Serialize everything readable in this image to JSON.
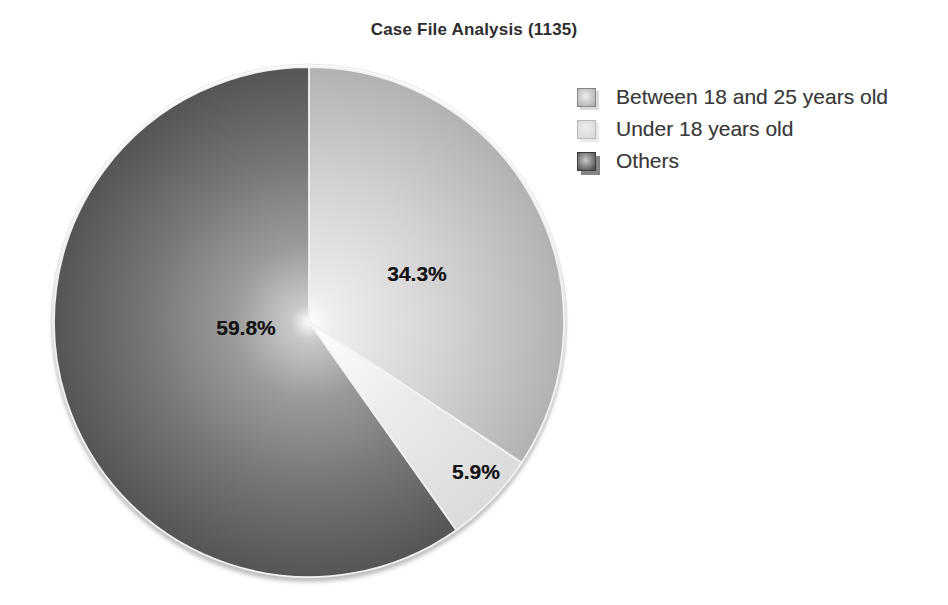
{
  "page": {
    "background_color": "#ffffff"
  },
  "chart_data": {
    "type": "pie",
    "title": "Case File Analysis (1135)",
    "total_count": 1135,
    "start_angle": "12-o-clock",
    "direction": "clockwise",
    "legend_position": "right",
    "slices": [
      {
        "label": "Between 18 and 25 years old",
        "value": 34.3,
        "display": "34.3%",
        "gradient": [
          [
            "0%",
            "#ffffff"
          ],
          [
            "10%",
            "#ededed"
          ],
          [
            "55%",
            "#d2d2d2"
          ],
          [
            "100%",
            "#b2b2b2"
          ]
        ]
      },
      {
        "label": "Under 18 years old",
        "value": 5.9,
        "display": "5.9%",
        "gradient": [
          [
            "0%",
            "#ffffff"
          ],
          [
            "45%",
            "#ececec"
          ],
          [
            "100%",
            "#dbdbdb"
          ]
        ]
      },
      {
        "label": "Others",
        "value": 59.8,
        "display": "59.8%",
        "gradient": [
          [
            "0%",
            "#ffffff"
          ],
          [
            "7%",
            "#c9c9c9"
          ],
          [
            "30%",
            "#9a9a9a"
          ],
          [
            "65%",
            "#757575"
          ],
          [
            "100%",
            "#555555"
          ]
        ]
      }
    ],
    "slice_border_color": "#f2f2f2",
    "outer_rim_color": "#c9c9c9",
    "shadow_color": "#bdbdbd"
  }
}
